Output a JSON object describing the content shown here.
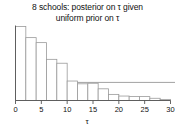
{
  "chart_data": {
    "type": "bar",
    "title": "8 schools:  posterior on τ given uniform prior on τ",
    "title_line1": "8 schools:  posterior on τ given",
    "title_line2": "uniform prior on τ",
    "xlabel": "τ",
    "ylabel": "",
    "grid": false,
    "legend": "none",
    "xlim": [
      0,
      30
    ],
    "ylim": [
      0,
      0.135
    ],
    "xticks": [
      0,
      5,
      10,
      15,
      20,
      25,
      30
    ],
    "xticklabels": [
      "0",
      "5",
      "10",
      "15",
      "20",
      "25",
      "30"
    ],
    "yticks": [],
    "yticklabels": [],
    "bin_width": 2,
    "bin_edges": [
      0,
      2,
      4,
      6,
      8,
      10,
      12,
      14,
      16,
      18,
      20,
      22,
      24,
      26,
      28,
      30
    ],
    "categories": [
      "0-2",
      "2-4",
      "4-6",
      "6-8",
      "8-10",
      "10-12",
      "12-14",
      "14-16",
      "16-18",
      "18-20",
      "20-22",
      "22-24",
      "24-26",
      "26-28",
      "28-30"
    ],
    "values": [
      0.133,
      0.113,
      0.104,
      0.074,
      0.067,
      0.035,
      0.03,
      0.031,
      0.021,
      0.011,
      0.008,
      0.007,
      0.007,
      0.004,
      0.002
    ],
    "reference_line": {
      "y": 0.0325,
      "orientation": "horizontal",
      "span": "full-width"
    },
    "colors": {
      "bar_edge": "#9a9a9a",
      "bar_fill": "#ffffff",
      "axis": "#555555",
      "reference_line": "#8a8a8a",
      "text": "#111111"
    }
  }
}
